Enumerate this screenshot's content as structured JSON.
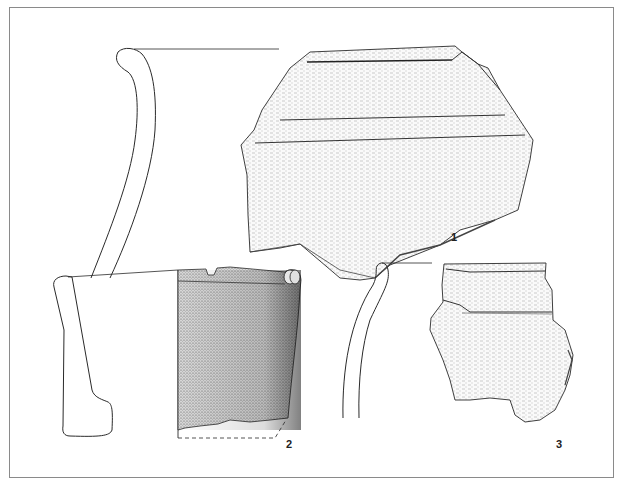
{
  "figure": {
    "type": "archaeological pottery drawing plate",
    "colors": {
      "line": "#2a2a2a",
      "stipple": "#555555",
      "border": "#8a8a8a",
      "background": "#ffffff"
    }
  },
  "fragments": [
    {
      "id": 1,
      "label": "1",
      "description": "Rim sherd with everted rim, profile section and exterior view with horizontal grooves"
    },
    {
      "id": 2,
      "label": "2",
      "description": "Straight-walled rim sherd with thickened base section, profile and exterior view with dashed reconstruction"
    },
    {
      "id": 3,
      "label": "3",
      "description": "Rim sherd with rounded rim, profile section and exterior view with grooves"
    }
  ]
}
